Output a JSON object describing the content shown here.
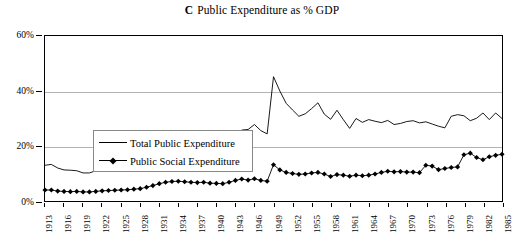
{
  "title": {
    "panel_letter": "C",
    "text": "Public Expenditure as % GDP"
  },
  "legend": {
    "items": [
      {
        "label": "Total Public Expenditure",
        "marker": "none",
        "color": "#000000"
      },
      {
        "label": "Public Social Expenditure",
        "marker": "diamond",
        "color": "#000000"
      }
    ]
  },
  "axes": {
    "y_ticks": [
      "0%",
      "20%",
      "40%",
      "60%"
    ],
    "x_ticks": [
      "1913",
      "1916",
      "1919",
      "1922",
      "1925",
      "1928",
      "1931",
      "1934",
      "1937",
      "1940",
      "1943",
      "1946",
      "1949",
      "1952",
      "1955",
      "1958",
      "1961",
      "1964",
      "1967",
      "1970",
      "1973",
      "1976",
      "1979",
      "1982",
      "1985"
    ]
  },
  "chart_data": {
    "type": "line",
    "xlabel": "",
    "ylabel": "% GDP",
    "ylim": [
      0,
      60
    ],
    "xlim": [
      1913,
      1985
    ],
    "ytick_values": [
      0,
      20,
      40,
      60
    ],
    "ytick_labels": [
      "0%",
      "20%",
      "40%",
      "60%"
    ],
    "gridlines": {
      "horizontal_at": [
        20,
        40
      ],
      "vertical": false
    },
    "legend_position": "upper-left-inside",
    "x": [
      1913,
      1914,
      1915,
      1916,
      1917,
      1918,
      1919,
      1920,
      1921,
      1922,
      1923,
      1924,
      1925,
      1926,
      1927,
      1928,
      1929,
      1930,
      1931,
      1932,
      1933,
      1934,
      1935,
      1936,
      1937,
      1938,
      1939,
      1940,
      1941,
      1942,
      1943,
      1944,
      1945,
      1946,
      1947,
      1948,
      1949,
      1950,
      1951,
      1952,
      1953,
      1954,
      1955,
      1956,
      1957,
      1958,
      1959,
      1960,
      1961,
      1962,
      1963,
      1964,
      1965,
      1966,
      1967,
      1968,
      1969,
      1970,
      1971,
      1972,
      1973,
      1974,
      1975,
      1976,
      1977,
      1978,
      1979,
      1980,
      1981,
      1982,
      1983,
      1984,
      1985
    ],
    "series": [
      {
        "name": "Total Public Expenditure",
        "marker": "none",
        "color": "#000000",
        "values": [
          13.0,
          13.3,
          12.0,
          11.3,
          11.2,
          11.0,
          10.2,
          10.2,
          11.0,
          11.8,
          11.7,
          11.5,
          11.4,
          11.8,
          12.6,
          13.0,
          15.0,
          13.6,
          13.5,
          16.5,
          19.0,
          20.3,
          21.2,
          21.5,
          21.4,
          21.4,
          20.4,
          20.3,
          20.5,
          21.0,
          22.8,
          25.8,
          26.0,
          27.8,
          25.6,
          24.4,
          45.2,
          40.0,
          35.5,
          33.1,
          30.8,
          31.7,
          33.6,
          35.7,
          31.6,
          29.7,
          33.0,
          29.6,
          26.4,
          30.0,
          28.6,
          29.6,
          29.0,
          28.5,
          29.3,
          27.8,
          28.2,
          28.9,
          29.2,
          28.4,
          28.8,
          28.0,
          27.2,
          26.6,
          30.8,
          31.4,
          31.0,
          29.2,
          30.1,
          32.0,
          29.6,
          32.0,
          30.0
        ]
      },
      {
        "name": "Public Social Expenditure",
        "marker": "diamond",
        "color": "#000000",
        "values": [
          4.0,
          4.0,
          3.6,
          3.5,
          3.4,
          3.5,
          3.3,
          3.3,
          3.5,
          3.7,
          3.8,
          3.9,
          4.0,
          4.1,
          4.3,
          4.5,
          5.0,
          5.6,
          6.3,
          6.8,
          7.1,
          7.2,
          7.0,
          6.8,
          6.7,
          6.8,
          6.5,
          6.4,
          6.3,
          6.8,
          7.5,
          8.0,
          7.6,
          8.1,
          7.5,
          7.2,
          13.2,
          11.3,
          10.4,
          10.0,
          9.7,
          9.8,
          10.2,
          10.4,
          9.8,
          8.9,
          9.6,
          9.4,
          9.0,
          9.4,
          9.2,
          9.4,
          9.8,
          10.4,
          10.8,
          10.6,
          10.7,
          10.5,
          10.5,
          10.3,
          13.0,
          12.7,
          11.4,
          11.8,
          12.2,
          12.4,
          16.8,
          17.4,
          15.8,
          15.0,
          16.1,
          16.6,
          17.0
        ]
      }
    ]
  }
}
